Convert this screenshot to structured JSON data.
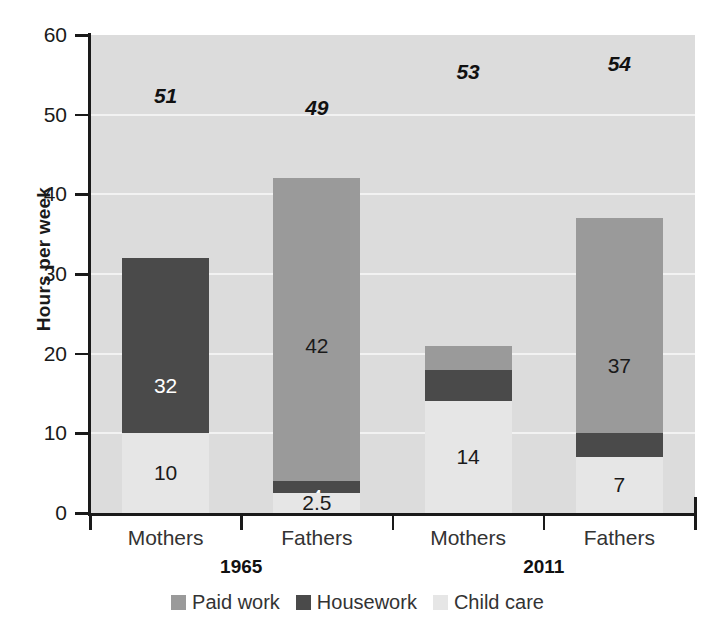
{
  "chart_data": {
    "type": "bar",
    "subtype": "stacked-bar",
    "title": "",
    "xlabel": "",
    "ylabel": "Hours per week",
    "ylim": [
      0,
      60
    ],
    "yticks": [
      0,
      10,
      20,
      30,
      40,
      50,
      60
    ],
    "grid": true,
    "legend_position": "bottom",
    "categories": [
      "Mothers",
      "Fathers",
      "Mothers",
      "Fathers"
    ],
    "groups": [
      "1965",
      "2011"
    ],
    "series": [
      {
        "name": "Paid work",
        "color": "#9a9a9a",
        "values": [
          8,
          42,
          21,
          37
        ]
      },
      {
        "name": "Housework",
        "color": "#4a4a4a",
        "values": [
          32,
          4,
          18,
          10
        ]
      },
      {
        "name": "Child care",
        "color": "#e6e6e6",
        "values": [
          10,
          2.5,
          14,
          7
        ]
      }
    ],
    "totals": [
      51,
      49,
      53,
      54
    ]
  },
  "axis": {
    "y_title": "Hours per week",
    "y_ticks": [
      {
        "label": "60",
        "value": 60
      },
      {
        "label": "50",
        "value": 50
      },
      {
        "label": "40",
        "value": 40
      },
      {
        "label": "30",
        "value": 30
      },
      {
        "label": "20",
        "value": 20
      },
      {
        "label": "10",
        "value": 10
      },
      {
        "label": "0",
        "value": 0
      }
    ]
  },
  "bars": [
    {
      "category": "Mothers",
      "era": "1965",
      "total_label": "51",
      "segments": [
        {
          "series": "Paid work",
          "value": 8,
          "label": "8",
          "text_tone": "dark"
        },
        {
          "series": "Housework",
          "value": 32,
          "label": "32",
          "text_tone": "light"
        },
        {
          "series": "Child care",
          "value": 10,
          "label": "10",
          "text_tone": "dark"
        }
      ]
    },
    {
      "category": "Fathers",
      "era": "1965",
      "total_label": "49",
      "segments": [
        {
          "series": "Paid work",
          "value": 42,
          "label": "42",
          "text_tone": "dark"
        },
        {
          "series": "Housework",
          "value": 4,
          "label": "4",
          "text_tone": "light"
        },
        {
          "series": "Child care",
          "value": 2.5,
          "label": "2.5",
          "text_tone": "dark"
        }
      ]
    },
    {
      "category": "Mothers",
      "era": "2011",
      "total_label": "53",
      "segments": [
        {
          "series": "Paid work",
          "value": 21,
          "label": "21",
          "text_tone": "dark"
        },
        {
          "series": "Housework",
          "value": 18,
          "label": "18",
          "text_tone": "light"
        },
        {
          "series": "Child care",
          "value": 14,
          "label": "14",
          "text_tone": "dark"
        }
      ]
    },
    {
      "category": "Fathers",
      "era": "2011",
      "total_label": "54",
      "segments": [
        {
          "series": "Paid work",
          "value": 37,
          "label": "37",
          "text_tone": "dark"
        },
        {
          "series": "Housework",
          "value": 10,
          "label": "10",
          "text_tone": "light"
        },
        {
          "series": "Child care",
          "value": 7,
          "label": "7",
          "text_tone": "dark"
        }
      ]
    }
  ],
  "era_labels": [
    {
      "label": "1965"
    },
    {
      "label": "2011"
    }
  ],
  "legend": {
    "items": [
      {
        "label": "Paid work",
        "color": "#9a9a9a"
      },
      {
        "label": "Housework",
        "color": "#4a4a4a"
      },
      {
        "label": "Child care",
        "color": "#e6e6e6"
      }
    ]
  },
  "colors": {
    "paid_work": "#9a9a9a",
    "housework": "#4a4a4a",
    "child_care": "#e6e6e6",
    "plot_background": "#dcdcdc",
    "gridline": "#f2f2f2",
    "axis": "#1a1a1a"
  }
}
